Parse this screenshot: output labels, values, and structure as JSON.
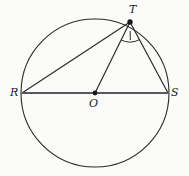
{
  "figure": {
    "type": "circle-geometry-diagram",
    "background_color": "#fbfbfa",
    "stroke_color": "#2b2b2b",
    "diameter_color": "#5a5a5a",
    "canvas": {
      "width": 189,
      "height": 176
    }
  },
  "circle": {
    "name": "main-circle",
    "center": {
      "x": 95,
      "y": 93
    },
    "radius": 74,
    "stroke_width": 1.1
  },
  "points": {
    "T": {
      "label": "T",
      "x": 130,
      "y": 22,
      "marker": "filled-dot",
      "label_position": "above"
    },
    "R": {
      "label": "R",
      "x": 22,
      "y": 93,
      "marker": "none",
      "label_position": "left"
    },
    "O": {
      "label": "O",
      "x": 95,
      "y": 93,
      "marker": "filled-dot",
      "label_position": "below"
    },
    "S": {
      "label": "S",
      "x": 168,
      "y": 93,
      "marker": "none",
      "label_position": "right"
    }
  },
  "segments": [
    {
      "name": "diameter-RS",
      "from": "R",
      "to": "S",
      "x1": 22,
      "y1": 93,
      "x2": 168,
      "y2": 93,
      "stroke_width": 2.0,
      "color": "#5a5a5a"
    },
    {
      "name": "chord-RT",
      "from": "R",
      "to": "T",
      "x1": 22,
      "y1": 93,
      "x2": 130,
      "y2": 22,
      "stroke_width": 1.2,
      "color": "#2b2b2b"
    },
    {
      "name": "radius-OT",
      "from": "O",
      "to": "T",
      "x1": 95,
      "y1": 93,
      "x2": 130,
      "y2": 22,
      "stroke_width": 1.2,
      "color": "#2b2b2b"
    },
    {
      "name": "chord-TS",
      "from": "T",
      "to": "S",
      "x1": 130,
      "y1": 22,
      "x2": 168,
      "y2": 93,
      "stroke_width": 1.2,
      "color": "#2b2b2b"
    }
  ],
  "angle_marks": [
    {
      "name": "angle-OTS",
      "vertex": "T",
      "ray_a": "O",
      "ray_b": "S",
      "arc_radius": 20,
      "ticks": 1,
      "tick_label": ""
    }
  ],
  "labels": {
    "T": "T",
    "R": "R",
    "O": "O",
    "S": "S"
  }
}
